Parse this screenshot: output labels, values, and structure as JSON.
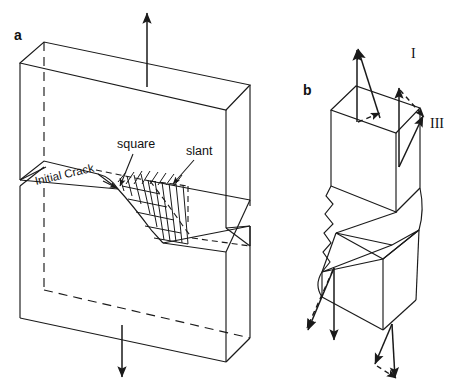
{
  "figure": {
    "background_color": "#ffffff",
    "line_color": "#1a1a1a",
    "panels": [
      {
        "id": "a",
        "label": "a",
        "label_x": 14,
        "label_y": 40,
        "description": "Cracked plate specimen under tension showing square and slant fracture regions"
      },
      {
        "id": "b",
        "label": "b",
        "label_x": 303,
        "label_y": 95,
        "description": "Separated fracture halves with Mode I and Mode III loading arrows"
      }
    ],
    "annotations": [
      {
        "name": "square-label",
        "text": "square",
        "x": 117,
        "y": 148,
        "anchor": "start"
      },
      {
        "name": "slant-label",
        "text": "slant",
        "x": 186,
        "y": 155,
        "anchor": "start"
      },
      {
        "name": "initial-crack-label",
        "text": "Initial Crack",
        "x": 36,
        "y": 185,
        "rotation": -13
      },
      {
        "name": "mode-one-label",
        "text": "I",
        "x": 411,
        "y": 58
      },
      {
        "name": "mode-three-label",
        "text": "III",
        "x": 430,
        "y": 128
      }
    ]
  }
}
